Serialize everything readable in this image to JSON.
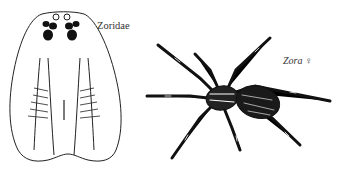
{
  "figure": {
    "family_label": "Zoridae",
    "genus_label": "Zora ♀",
    "panels": [
      {
        "name": "carapace-dorsal-view",
        "description": "Dorsal outline of cephalothorax with eye group"
      },
      {
        "name": "spider-habitus",
        "description": "Whole spider, dorsal view, Zora female"
      }
    ],
    "colors": {
      "ink": "#111111",
      "background": "#ffffff"
    }
  }
}
